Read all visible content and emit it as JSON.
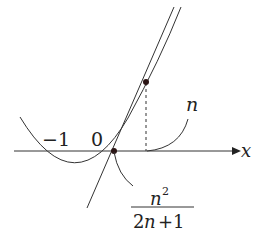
{
  "diagram": {
    "type": "function-graph",
    "axis": {
      "label": "x"
    },
    "labels": {
      "minus_one": "−1",
      "zero": "0",
      "n": "n",
      "frac_num_base": "n",
      "frac_num_exp": "2",
      "frac_den": "2n+1",
      "frac_den_2": "2",
      "frac_den_n": "n",
      "frac_den_plus": "+1"
    },
    "elements": [
      {
        "name": "parabola",
        "description": "curve crossing x-axis at -1 and 0"
      },
      {
        "name": "tangent-line",
        "description": "tangent at point above x=n, meeting x-axis at n^2/(2n+1)"
      },
      {
        "name": "tangent-point",
        "description": "dot on curve above x=n"
      },
      {
        "name": "intercept-point",
        "description": "dot at x = n^2/(2n+1)"
      },
      {
        "name": "dashed-drop",
        "description": "vertical dashed line from tangent point to x-axis at n"
      }
    ],
    "colors": {
      "stroke": "#333333",
      "dot": "#2a1414"
    }
  }
}
